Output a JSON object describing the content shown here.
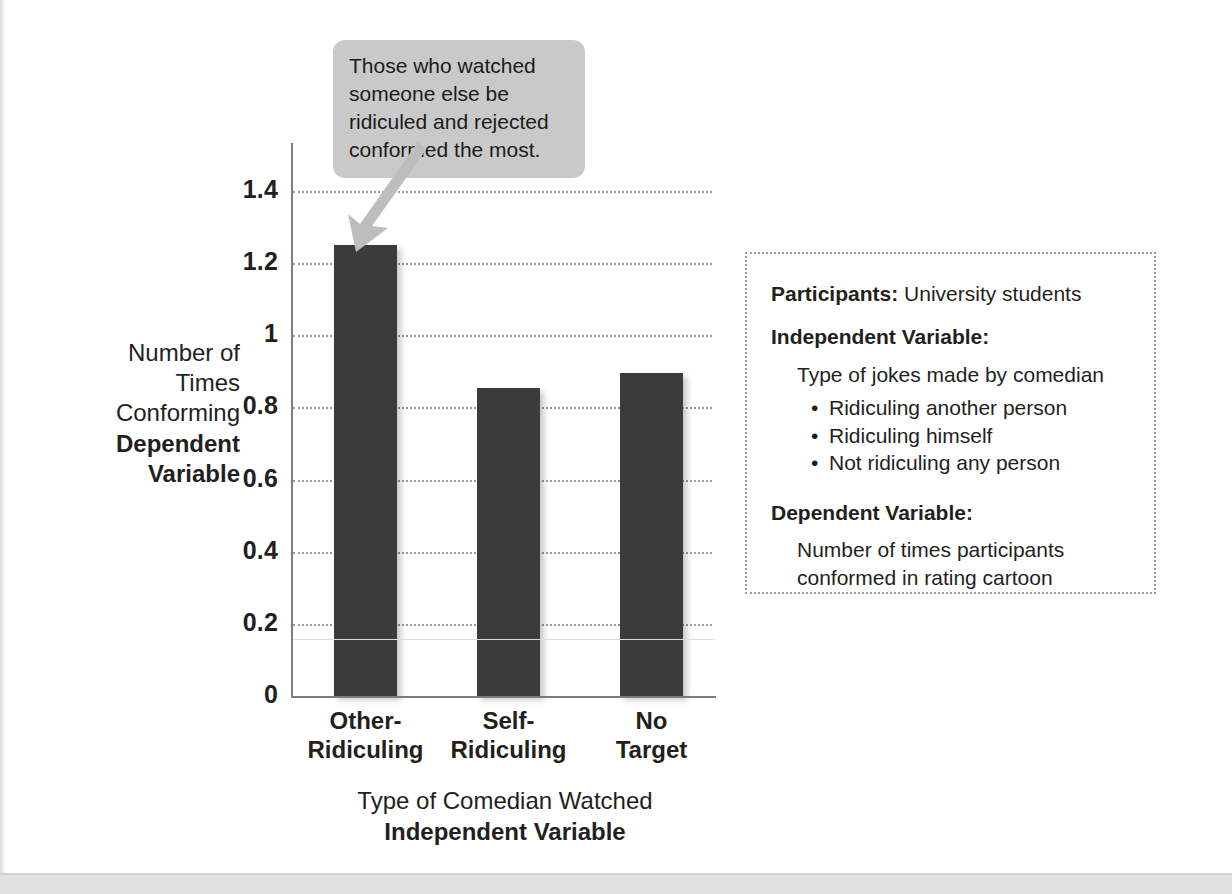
{
  "chart_data": {
    "type": "bar",
    "title": "",
    "categories": [
      "Other-Ridiculing",
      "Self-Ridiculing",
      "No Target"
    ],
    "category_lines": [
      [
        "Other-",
        "Ridiculing"
      ],
      [
        "Self-",
        "Ridiculing"
      ],
      [
        "No",
        "Target"
      ]
    ],
    "values": [
      1.25,
      0.855,
      0.895
    ],
    "xlabel": "Type of Comedian Watched",
    "xlabel_sub": "Independent Variable",
    "ylabel": "Number of Times Conforming",
    "ylabel_sub": "Dependent Variable",
    "ylabel_lines": [
      "Number of",
      "Times",
      "Conforming"
    ],
    "ylim": [
      0,
      1.4
    ],
    "yticks": [
      "1.4",
      "1.2",
      "1",
      "0.8",
      "0.6",
      "0.4",
      "0.2",
      "0"
    ],
    "ytick_values": [
      1.4,
      1.2,
      1,
      0.8,
      0.6,
      0.4,
      0.2,
      0
    ],
    "grid": true,
    "legend": "none",
    "bar_color": "#3b3b3b",
    "grid_color": "#9a9a9a",
    "axis_color": "#7c7c7c"
  },
  "callout": {
    "text": "Those who watched someone else be ridiculed and rejected conformed the most.",
    "background": "#c9c9c9",
    "arrow_color": "#bdbdbd"
  },
  "info_panel": {
    "participants_label": "Participants:",
    "participants_value": " University students",
    "iv_heading": "Independent Variable:",
    "iv_description": "Type of jokes made by comedian",
    "iv_bullets": [
      "Ridiculing another person",
      "Ridiculing himself",
      "Not ridiculing any person"
    ],
    "dv_heading": "Dependent Variable:",
    "dv_description": "Number of times participants conformed in rating cartoon"
  }
}
